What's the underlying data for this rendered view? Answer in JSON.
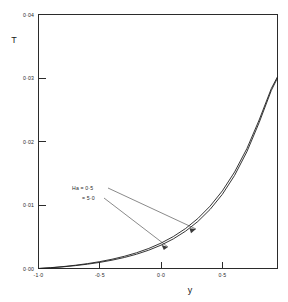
{
  "chart_data": {
    "type": "line",
    "title": "",
    "xlabel": "y",
    "ylabel": "T",
    "xlim": [
      -1.0,
      0.95
    ],
    "ylim": [
      0.0,
      0.04
    ],
    "grid": false,
    "legend_position": "inline-annotations",
    "xticks": [
      -1.0,
      -0.5,
      0.0,
      0.5
    ],
    "xtick_labels": [
      "-1·0",
      "-0·5",
      "0·0",
      "0·5"
    ],
    "yticks": [
      0.0,
      0.01,
      0.02,
      0.03,
      0.04
    ],
    "ytick_labels": [
      "0·00",
      "0·01",
      "0·02",
      "0·03",
      "0·04"
    ],
    "annotations": [
      {
        "text": "Ha = 0·5",
        "points_to_series": "Ha = 0.5"
      },
      {
        "text": "= 5·0",
        "points_to_series": "Ha = 5.0"
      }
    ],
    "x": [
      -1.0,
      -0.9,
      -0.8,
      -0.7,
      -0.6,
      -0.5,
      -0.4,
      -0.3,
      -0.2,
      -0.1,
      0.0,
      0.1,
      0.2,
      0.3,
      0.4,
      0.5,
      0.6,
      0.7,
      0.8,
      0.9,
      0.95
    ],
    "series": [
      {
        "name": "Ha = 0.5",
        "values": [
          0.0,
          0.00013,
          0.0003,
          0.00051,
          0.00077,
          0.00108,
          0.00146,
          0.00192,
          0.00248,
          0.00316,
          0.004,
          0.00503,
          0.0063,
          0.00787,
          0.00982,
          0.01222,
          0.0152,
          0.01888,
          0.02338,
          0.02836,
          0.0302
        ]
      },
      {
        "name": "Ha = 5.0",
        "values": [
          0.0,
          0.00011,
          0.00026,
          0.00045,
          0.00068,
          0.00096,
          0.00131,
          0.00173,
          0.00225,
          0.00289,
          0.00368,
          0.00466,
          0.00588,
          0.0074,
          0.0093,
          0.01168,
          0.01466,
          0.01838,
          0.02296,
          0.02806,
          0.03
        ]
      }
    ]
  },
  "axes": {
    "y_axis_title": "T",
    "x_axis_title": "y"
  }
}
